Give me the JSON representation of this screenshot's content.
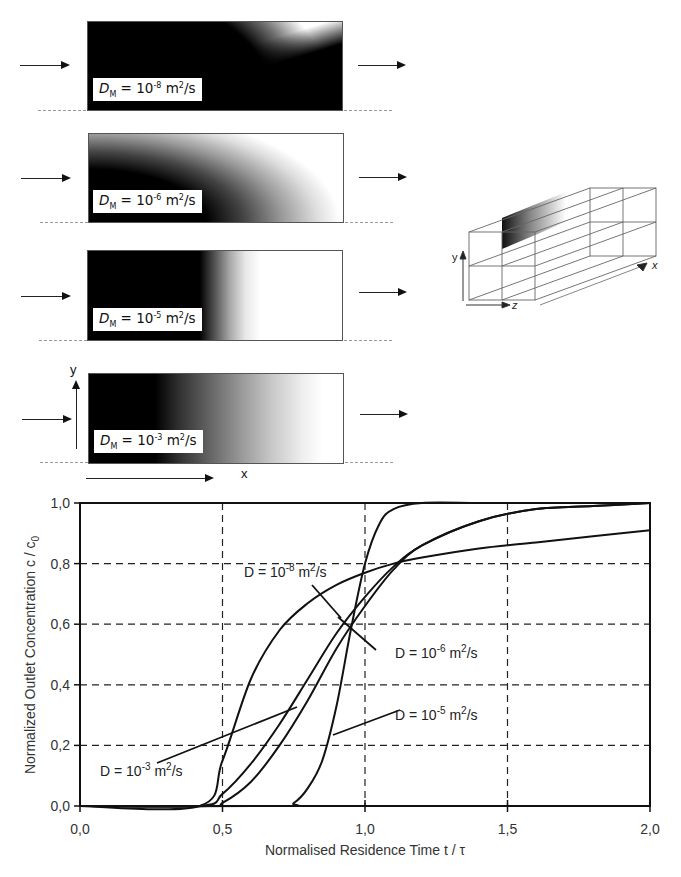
{
  "diagram": {
    "channels": [
      {
        "label_prefix": "D",
        "label_sub": "M",
        "label_eq": " = 10",
        "label_exp": "-8",
        "label_unit": " m",
        "label_unit_exp": "2",
        "label_tail": "/s"
      },
      {
        "label_prefix": "D",
        "label_sub": "M",
        "label_eq": " = 10",
        "label_exp": "-6",
        "label_unit": " m",
        "label_unit_exp": "2",
        "label_tail": "/s"
      },
      {
        "label_prefix": "D",
        "label_sub": "M",
        "label_eq": " = 10",
        "label_exp": "-5",
        "label_unit": " m",
        "label_unit_exp": "2",
        "label_tail": "/s"
      },
      {
        "label_prefix": "D",
        "label_sub": "M",
        "label_eq": " = 10",
        "label_exp": "-3",
        "label_unit": " m",
        "label_unit_exp": "2",
        "label_tail": "/s"
      }
    ],
    "axis_y": "y",
    "axis_x": "x",
    "box3d": {
      "x": "x",
      "y": "y",
      "z": "z"
    }
  },
  "chart_data": {
    "type": "line",
    "title": "",
    "xlabel": "Normalised Residence Time t / τ",
    "ylabel": "Normalized Outlet Concentration c / c0",
    "ylabel_main": "Normalized Outlet Concentration c / c",
    "ylabel_sub": "0",
    "xlim": [
      0.0,
      2.0
    ],
    "ylim": [
      0.0,
      1.0
    ],
    "x_ticks": [
      "0,0",
      "0,5",
      "1,0",
      "1,5",
      "2,0"
    ],
    "y_ticks": [
      "0,0",
      "0,2",
      "0,4",
      "0,6",
      "0,8",
      "1,0"
    ],
    "grid": "dashed",
    "series": [
      {
        "name": "D = 10^-8 m²/s",
        "x": [
          0.42,
          0.5,
          0.6,
          0.7,
          0.8,
          0.9,
          1.0,
          1.1,
          1.2,
          1.4,
          1.6,
          1.8,
          2.0
        ],
        "y": [
          0.0,
          0.15,
          0.42,
          0.58,
          0.67,
          0.73,
          0.77,
          0.8,
          0.82,
          0.85,
          0.87,
          0.89,
          0.91
        ]
      },
      {
        "name": "D = 10^-6 m²/s",
        "x": [
          0.42,
          0.5,
          0.6,
          0.7,
          0.8,
          0.9,
          1.0,
          1.1,
          1.2,
          1.4,
          1.6,
          1.8,
          2.0
        ],
        "y": [
          0.0,
          0.04,
          0.14,
          0.27,
          0.42,
          0.57,
          0.69,
          0.79,
          0.86,
          0.94,
          0.98,
          0.99,
          1.0
        ]
      },
      {
        "name": "D = 10^-5 m²/s",
        "x": [
          0.45,
          0.5,
          0.6,
          0.7,
          0.8,
          0.9,
          1.0,
          1.1,
          1.2,
          1.4,
          1.6,
          1.8,
          2.0
        ],
        "y": [
          0.0,
          0.01,
          0.08,
          0.2,
          0.35,
          0.52,
          0.66,
          0.78,
          0.86,
          0.94,
          0.98,
          0.99,
          1.0
        ]
      },
      {
        "name": "D = 10^-3 m²/s",
        "x": [
          0.7,
          0.75,
          0.8,
          0.85,
          0.9,
          0.95,
          1.0,
          1.05,
          1.1,
          1.2,
          1.4,
          1.6,
          2.0
        ],
        "y": [
          0.0,
          0.01,
          0.06,
          0.15,
          0.33,
          0.58,
          0.8,
          0.93,
          0.98,
          1.0,
          1.0,
          1.0,
          1.0
        ]
      }
    ],
    "annotations": [
      {
        "text_main": "D = 10",
        "text_exp": "-8",
        "text_unit": " m",
        "text_unit_exp": "2",
        "text_tail": "/s"
      },
      {
        "text_main": "D = 10",
        "text_exp": "-6",
        "text_unit": " m",
        "text_unit_exp": "2",
        "text_tail": "/s"
      },
      {
        "text_main": "D = 10",
        "text_exp": "-5",
        "text_unit": " m",
        "text_unit_exp": "2",
        "text_tail": "/s"
      },
      {
        "text_main": "D = 10",
        "text_exp": "-3",
        "text_unit": " m",
        "text_unit_exp": "2",
        "text_tail": "/s"
      }
    ]
  }
}
